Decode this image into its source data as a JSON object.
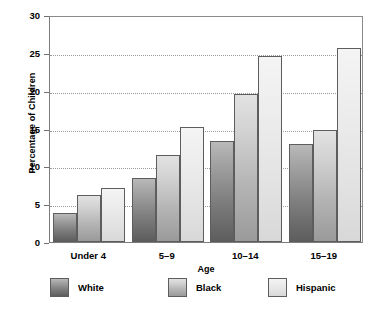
{
  "chart_data": {
    "type": "bar",
    "title": "",
    "xlabel": "Age",
    "ylabel": "Percentage of Children",
    "categories": [
      "Under 4",
      "5–9",
      "10–14",
      "15–19"
    ],
    "series": [
      {
        "name": "White",
        "values": [
          3.8,
          8.4,
          13.3,
          13.0
        ],
        "color": "#7e7e7e"
      },
      {
        "name": "Black",
        "values": [
          6.2,
          11.5,
          19.5,
          14.8
        ],
        "color": "#b4b4b4"
      },
      {
        "name": "Hispanic",
        "values": [
          7.2,
          15.2,
          24.6,
          25.6
        ],
        "color": "#e2e2e2"
      }
    ],
    "ylim": [
      0,
      30
    ],
    "yticks": [
      0,
      5,
      10,
      15,
      20,
      25,
      30
    ],
    "ytick_labels": [
      "0",
      "5",
      "10",
      "15",
      "20",
      "25",
      "30"
    ],
    "grid": true,
    "legend_position": "bottom"
  },
  "axes": {
    "y_title": "Percentage of Children",
    "x_title": "Age"
  },
  "legend": {
    "items": [
      {
        "label": "White"
      },
      {
        "label": "Black"
      },
      {
        "label": "Hispanic"
      }
    ]
  }
}
